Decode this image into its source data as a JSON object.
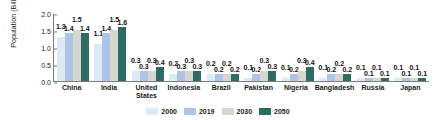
{
  "chart_data": {
    "type": "bar",
    "title": "",
    "xlabel": "",
    "ylabel": "Population (Billions)",
    "ylim": [
      0.0,
      2.0
    ],
    "yticks": [
      "0.0",
      "0.5",
      "1.0",
      "1.5",
      "2.0"
    ],
    "ytick_values": [
      0.0,
      0.5,
      1.0,
      1.5,
      2.0
    ],
    "grid": false,
    "legend_position": "bottom",
    "categories": [
      "China",
      "India",
      "United States",
      "Indonesia",
      "Brazil",
      "Pakistan",
      "Nigeria",
      "Bangladesh",
      "Russia",
      "Japan"
    ],
    "series": [
      {
        "name": "2000",
        "color": "#dceaf5",
        "values": [
          1.3,
          1.1,
          0.3,
          0.2,
          0.2,
          0.1,
          0.1,
          0.1,
          0.1,
          0.1
        ],
        "labels": [
          "1.3",
          "1.1",
          "0.3",
          "0.2",
          "0.2",
          "0.1",
          "0.1",
          "0.1",
          "0.1",
          "0.1"
        ]
      },
      {
        "name": "2019",
        "color": "#aec4e6",
        "values": [
          1.4,
          1.4,
          0.3,
          0.3,
          0.2,
          0.2,
          0.2,
          0.2,
          0.1,
          0.1
        ],
        "labels": [
          "1.4",
          "1.4",
          "0.3",
          "0.3",
          "0.2",
          "0.2",
          "0.2",
          "0.2",
          "0.1",
          "0.1"
        ]
      },
      {
        "name": "2030",
        "color": "#d7d7d2",
        "values": [
          1.5,
          1.5,
          0.3,
          0.3,
          0.2,
          0.3,
          0.3,
          0.2,
          0.1,
          0.1
        ],
        "labels": [
          "1.5",
          "1.5",
          "0.3",
          "0.3",
          "0.2",
          "0.3",
          "0.3",
          "0.2",
          "0.1",
          "0.1"
        ]
      },
      {
        "name": "2050",
        "color": "#2d6b63",
        "values": [
          1.4,
          1.6,
          0.4,
          0.3,
          0.2,
          0.3,
          0.4,
          0.2,
          0.1,
          0.1
        ],
        "labels": [
          "1.4",
          "1.6",
          "0.4",
          "0.3",
          "0.2",
          "0.3",
          "0.4",
          "0.2",
          "0.1",
          "0.1"
        ]
      }
    ]
  },
  "legend": {
    "items": [
      {
        "label": "2000",
        "color": "#dceaf5"
      },
      {
        "label": "2019",
        "color": "#aec4e6"
      },
      {
        "label": "2030",
        "color": "#d7d7d2"
      },
      {
        "label": "2050",
        "color": "#2d6b63"
      }
    ]
  },
  "axis": {
    "y_title": "Population (Billions)"
  }
}
